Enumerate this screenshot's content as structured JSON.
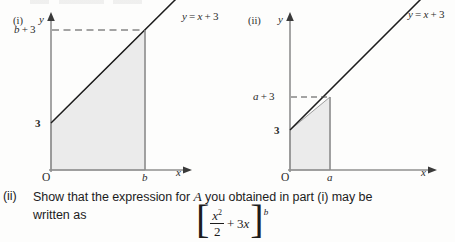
{
  "page": {
    "background": "#fdfdfc",
    "ink": "#2b2b2b",
    "shade_fill": "#ebebeb",
    "shade_stroke": "#9a9a9a",
    "line_color": "#1c1c1c",
    "axis_color": "#8a8a8a"
  },
  "figures": [
    {
      "id": "figure-i",
      "marker": "(i)",
      "y_axis_label": "y",
      "x_axis_label": "x",
      "origin_label": "O",
      "line_label": "y = x + 3",
      "y_intercept_label": "3",
      "upper_y_label": "b + 3",
      "x_tick_label": "b",
      "dashed_guide": true,
      "description": "Shaded trapezium under y = x + 3 from x = 0 to x = b"
    },
    {
      "id": "figure-ii",
      "marker": "(ii)",
      "y_axis_label": "y",
      "x_axis_label": "x",
      "origin_label": "O",
      "line_label": "y = x + 3",
      "y_intercept_label": "3",
      "upper_y_label": "a + 3",
      "x_tick_label": "a",
      "dashed_guide": true,
      "description": "Shaded trapezium under y = x + 3 from x = 0 to x = a"
    }
  ],
  "question": {
    "marker": "(ii)",
    "line1_before": "Show that the expression for ",
    "line1_var": "A",
    "line1_after": " you obtained in part (i) may be",
    "line2": "written as",
    "expression": {
      "bracket_left": "[",
      "bracket_right": "]",
      "numerator": "x",
      "numerator_exponent": "2",
      "denominator": "2",
      "addend": "+ 3x",
      "superscript_limit": "b"
    }
  }
}
